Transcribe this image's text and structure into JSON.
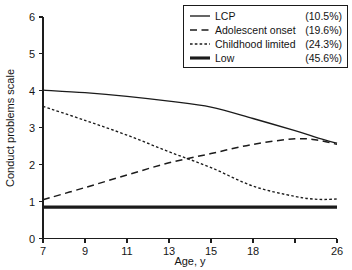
{
  "chart_data": {
    "type": "line",
    "title": "",
    "xlabel": "Age, y",
    "ylabel": "Conduct problems scale",
    "xlim": [
      7,
      26
    ],
    "ylim": [
      0,
      6
    ],
    "grid": false,
    "legend_position": "top-right",
    "x_ticks": [
      {
        "value": 7,
        "label": "7"
      },
      {
        "value": 9,
        "label": "9"
      },
      {
        "value": 11,
        "label": "11"
      },
      {
        "value": 13,
        "label": "13"
      },
      {
        "value": 15,
        "label": "15"
      },
      {
        "value": 18,
        "label": "18"
      },
      {
        "value": 21.5,
        "label": ""
      },
      {
        "value": 26,
        "label": "26"
      }
    ],
    "y_ticks": [
      {
        "value": 0,
        "label": "0"
      },
      {
        "value": 1,
        "label": "1"
      },
      {
        "value": 2,
        "label": "2"
      },
      {
        "value": 3,
        "label": "3"
      },
      {
        "value": 4,
        "label": "4"
      },
      {
        "value": 5,
        "label": "5"
      },
      {
        "value": 6,
        "label": "6"
      }
    ],
    "x": [
      7,
      9,
      11,
      13,
      15,
      18,
      21.5,
      24,
      26
    ],
    "series": [
      {
        "name": "LCP",
        "percent": "(10.5%)",
        "style": "solid",
        "values": [
          4.02,
          3.95,
          3.85,
          3.72,
          3.56,
          3.25,
          2.92,
          2.72,
          2.58
        ]
      },
      {
        "name": "Adolescent onset",
        "percent": "(19.6%)",
        "style": "long-dash",
        "values": [
          1.05,
          1.38,
          1.72,
          2.05,
          2.3,
          2.55,
          2.7,
          2.66,
          2.55
        ]
      },
      {
        "name": "Childhood limited",
        "percent": "(24.3%)",
        "style": "short-dash",
        "values": [
          3.58,
          3.2,
          2.8,
          2.35,
          1.92,
          1.42,
          1.14,
          1.06,
          1.07
        ]
      },
      {
        "name": "Low",
        "percent": "(45.6%)",
        "style": "thick-solid",
        "values": [
          0.85,
          0.85,
          0.85,
          0.85,
          0.85,
          0.85,
          0.85,
          0.85,
          0.85
        ]
      }
    ]
  },
  "legend": {
    "entries": [
      {
        "label": "LCP",
        "percent": "(10.5%)"
      },
      {
        "label": "Adolescent onset",
        "percent": "(19.6%)"
      },
      {
        "label": "Childhood limited",
        "percent": "(24.3%)"
      },
      {
        "label": "Low",
        "percent": "(45.6%)"
      }
    ]
  },
  "axes": {
    "x_title": "Age, y",
    "y_title": "Conduct problems scale"
  },
  "colors": {
    "ink": "#1b1b1b",
    "background": "#ffffff"
  }
}
